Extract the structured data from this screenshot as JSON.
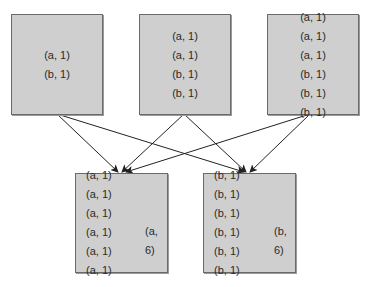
{
  "mappers": [
    {
      "id": "mapper-1",
      "pairs": [
        "(a, 1)",
        "(b, 1)"
      ]
    },
    {
      "id": "mapper-2",
      "pairs": [
        "(a, 1)",
        "(a, 1)",
        "(b, 1)",
        "(b, 1)"
      ]
    },
    {
      "id": "mapper-3",
      "pairs": [
        "(a, 1)",
        "(a, 1)",
        "(a, 1)",
        "(b, 1)",
        "(b, 1)",
        "(b, 1)"
      ]
    }
  ],
  "reducers": [
    {
      "id": "reducer-a",
      "pairs": [
        "(a, 1)",
        "(a, 1)",
        "(a, 1)",
        "(a, 1)",
        "(a, 1)",
        "(a, 1)"
      ],
      "result": "(a, 6)"
    },
    {
      "id": "reducer-b",
      "pairs": [
        "(b, 1)",
        "(b, 1)",
        "(b, 1)",
        "(b, 1)",
        "(b, 1)",
        "(b, 1)"
      ],
      "result": "(b, 6)"
    }
  ],
  "colors": {
    "box_fill": "#cfcfcf",
    "box_border": "#6a6a6a",
    "line": "#222222",
    "text": "#2a2a2a"
  }
}
